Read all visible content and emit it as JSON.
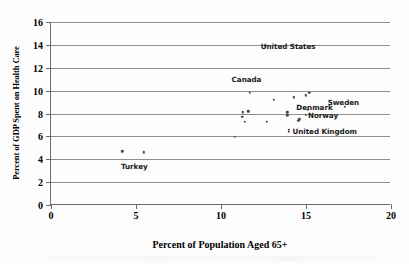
{
  "chart_data": {
    "type": "scatter",
    "title": "",
    "xlabel": "Percent of Population Aged 65+",
    "ylabel": "Percent of GDP Spent on Health Care",
    "xlim": [
      0,
      20
    ],
    "ylim": [
      0,
      16
    ],
    "xticks": [
      0,
      5,
      10,
      15,
      20
    ],
    "yticks": [
      0,
      2,
      4,
      6,
      8,
      10,
      12,
      14,
      16
    ],
    "xtick_labels": [
      "0",
      "5",
      "10",
      "15",
      "20"
    ],
    "ytick_labels": [
      "0",
      "2",
      "4",
      "6",
      "8",
      "10",
      "12",
      "14",
      "16"
    ],
    "grid": "horizontal",
    "legend": "none",
    "marker": "small-dot",
    "points": [
      {
        "x": 12.6,
        "y": 13.9,
        "label": "United States"
      },
      {
        "x": 11.7,
        "y": 9.8,
        "label": "Canada"
      },
      {
        "x": 15.2,
        "y": 9.8,
        "label": "Sweden"
      },
      {
        "x": 15.0,
        "y": 9.6,
        "label": ""
      },
      {
        "x": 14.3,
        "y": 9.4,
        "label": ""
      },
      {
        "x": 13.1,
        "y": 9.2,
        "label": ""
      },
      {
        "x": 17.3,
        "y": 8.6,
        "label": ""
      },
      {
        "x": 15.1,
        "y": 8.3,
        "label": "Denmark"
      },
      {
        "x": 11.6,
        "y": 8.2,
        "label": ""
      },
      {
        "x": 13.9,
        "y": 8.1,
        "label": ""
      },
      {
        "x": 11.3,
        "y": 8.1,
        "label": ""
      },
      {
        "x": 15.0,
        "y": 7.9,
        "label": "Norway"
      },
      {
        "x": 13.9,
        "y": 7.85,
        "label": ""
      },
      {
        "x": 11.25,
        "y": 7.7,
        "label": ""
      },
      {
        "x": 14.6,
        "y": 7.5,
        "label": ""
      },
      {
        "x": 14.55,
        "y": 7.35,
        "label": ""
      },
      {
        "x": 12.7,
        "y": 7.3,
        "label": ""
      },
      {
        "x": 11.4,
        "y": 7.25,
        "label": ""
      },
      {
        "x": 14.0,
        "y": 6.6,
        "label": "United Kingdom"
      },
      {
        "x": 14.0,
        "y": 6.4,
        "label": ""
      },
      {
        "x": 10.8,
        "y": 5.95,
        "label": ""
      },
      {
        "x": 4.2,
        "y": 4.7,
        "label": "Turkey"
      },
      {
        "x": 5.45,
        "y": 4.6,
        "label": ""
      }
    ],
    "annotations": [
      {
        "text": "United States",
        "x": 13.95,
        "y": 13.9
      },
      {
        "text": "Canada",
        "x": 11.5,
        "y": 11.05
      },
      {
        "text": "Sweden",
        "x": 17.2,
        "y": 9.0
      },
      {
        "text": "Denmark",
        "x": 15.5,
        "y": 8.55
      },
      {
        "text": "Norway",
        "x": 16.0,
        "y": 7.9
      },
      {
        "text": "United Kingdom",
        "x": 16.1,
        "y": 6.5
      },
      {
        "text": "Turkey",
        "x": 4.9,
        "y": 3.4
      }
    ],
    "colors": {
      "marker": "#4a4a4a",
      "gridline": "#8f8f8f",
      "axis": "#6b6b6b",
      "text": "#000000",
      "background": "#ffffff"
    }
  }
}
